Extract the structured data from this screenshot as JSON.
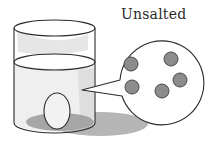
{
  "figure": {
    "label": "Unsalted",
    "callout": {
      "description": "magnified view of water particles",
      "particle_count": 5
    },
    "colors": {
      "outline": "#2a2a2a",
      "water_tint": "#e6e6e6",
      "shadow": "#9a9a9a",
      "particle_fill": "#8c8c8c",
      "background": "#ffffff"
    }
  }
}
